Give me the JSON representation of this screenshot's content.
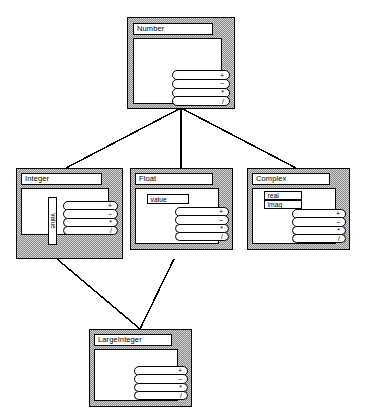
{
  "diagram": {
    "background_color": "#ffffff",
    "line_color": "#000000",
    "box_fill_color": "#ffffff",
    "box_shade_color": "#b4b4b4",
    "operators": [
      "+",
      "−",
      "*",
      "/"
    ],
    "classes": [
      {
        "id": "number",
        "name": "Number",
        "attributes": [],
        "operations": [
          "+",
          "−",
          "*",
          "/"
        ]
      },
      {
        "id": "integer",
        "name": "Integer",
        "attributes": [
          "value"
        ],
        "attribute_orientation": "vertical",
        "operations": [
          "+",
          "−",
          "*",
          "/"
        ]
      },
      {
        "id": "float",
        "name": "Float",
        "attributes": [
          "value"
        ],
        "attribute_orientation": "horizontal",
        "operations": [
          "+",
          "−",
          "*",
          "/"
        ]
      },
      {
        "id": "complex",
        "name": "Complex",
        "attributes": [
          "real",
          "imag"
        ],
        "attribute_orientation": "horizontal",
        "operations": [
          "+",
          "−",
          "*",
          "/"
        ]
      },
      {
        "id": "largeinteger",
        "name": "LargeInteger",
        "attributes": [],
        "operations": [
          "+",
          "−",
          "*",
          "/"
        ]
      }
    ],
    "edges": [
      {
        "from": "number",
        "to": "integer"
      },
      {
        "from": "number",
        "to": "float"
      },
      {
        "from": "number",
        "to": "complex"
      },
      {
        "from": "integer",
        "to": "largeinteger"
      },
      {
        "from": "float",
        "to": "largeinteger"
      }
    ]
  }
}
